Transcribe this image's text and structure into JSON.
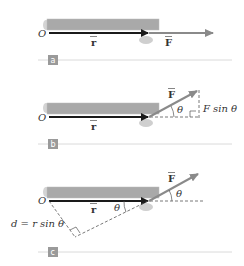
{
  "panels": [
    {
      "id": "a",
      "badge": "a",
      "origin_label": "O",
      "r_label": "r",
      "F_label": "F"
    },
    {
      "id": "b",
      "badge": "b",
      "origin_label": "O",
      "r_label": "r",
      "F_label": "F",
      "angle_label": "θ",
      "component_label": "F sin θ"
    },
    {
      "id": "c",
      "badge": "c",
      "origin_label": "O",
      "r_label": "r",
      "F_label": "F",
      "angle_label_top": "θ",
      "angle_label_inner": "θ",
      "moment_arm_label": "d = r sin θ"
    }
  ],
  "colors": {
    "rod": "#a9a9a9",
    "rod_edge": "#c8c8c8",
    "r_vector": "#1a1a1a",
    "F_vector": "#8a8a8a",
    "badge": "#9a9a9a",
    "separator": "#d0d0d0",
    "pivot": "#c8c8c8"
  }
}
